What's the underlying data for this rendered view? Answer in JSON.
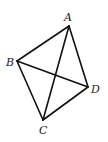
{
  "diagram": {
    "type": "geometry",
    "colors": {
      "line": "#111111",
      "label": "#222222",
      "background": "#ffffff"
    },
    "vertices": [
      {
        "id": "A",
        "label": "A",
        "x": 69,
        "y": 26,
        "lx": 64,
        "ly": 21
      },
      {
        "id": "B",
        "label": "B",
        "x": 17,
        "y": 61,
        "lx": 6,
        "ly": 66
      },
      {
        "id": "C",
        "label": "C",
        "x": 43,
        "y": 120,
        "lx": 39,
        "ly": 134
      },
      {
        "id": "D",
        "label": "D",
        "x": 88,
        "y": 87,
        "lx": 91,
        "ly": 93
      }
    ],
    "edges": [
      {
        "from": "A",
        "to": "B"
      },
      {
        "from": "B",
        "to": "C"
      },
      {
        "from": "C",
        "to": "D"
      },
      {
        "from": "D",
        "to": "A"
      },
      {
        "from": "A",
        "to": "C"
      },
      {
        "from": "B",
        "to": "D"
      }
    ]
  }
}
